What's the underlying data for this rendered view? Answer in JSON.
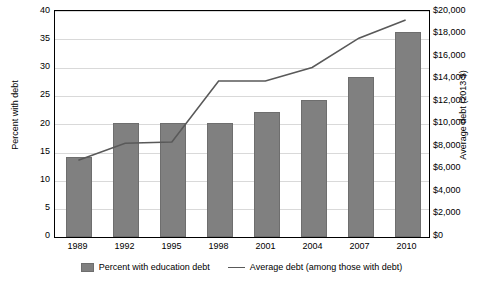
{
  "chart_data": {
    "type": "bar",
    "title": "",
    "subtitle": "",
    "categories": [
      "1989",
      "1992",
      "1995",
      "1998",
      "2001",
      "2004",
      "2007",
      "2010"
    ],
    "xlabel": "",
    "grid": true,
    "legend_position": "bottom",
    "series": [
      {
        "name": "Percent with education debt",
        "type": "bar",
        "axis": "left",
        "values": [
          14,
          20,
          20,
          20,
          22,
          24,
          28,
          36
        ]
      },
      {
        "name": "Average debt (among those with debt)",
        "type": "line",
        "axis": "right",
        "values": [
          6800,
          8300,
          8400,
          13800,
          13800,
          15000,
          17600,
          19200
        ]
      }
    ],
    "left_axis": {
      "label": "Percent with debt",
      "ticks": [
        "0",
        "5",
        "10",
        "15",
        "20",
        "25",
        "30",
        "35",
        "40"
      ],
      "tick_values": [
        0,
        5,
        10,
        15,
        20,
        25,
        30,
        35,
        40
      ],
      "ylim": [
        0,
        40
      ]
    },
    "right_axis": {
      "label": "Average debt (2013 $)",
      "ticks": [
        "$0",
        "$2,000",
        "$4,000",
        "$6,000",
        "$8,000",
        "$10,000",
        "$12,000",
        "$14,000",
        "$16,000",
        "$18,000",
        "$20,000"
      ],
      "tick_values": [
        0,
        2000,
        4000,
        6000,
        8000,
        10000,
        12000,
        14000,
        16000,
        18000,
        20000
      ],
      "ylim": [
        0,
        20000
      ]
    },
    "legend": [
      {
        "label": "Percent with education debt",
        "marker": "bar-swatch",
        "color": "#808080"
      },
      {
        "label": "Average debt (among those with debt)",
        "marker": "line-swatch",
        "color": "#595959"
      }
    ]
  }
}
